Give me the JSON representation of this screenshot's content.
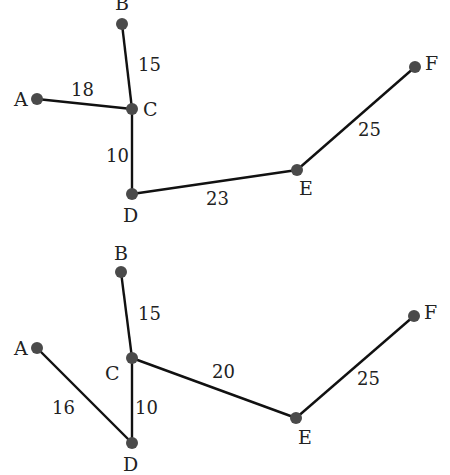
{
  "graphs": [
    {
      "name": "top-graph",
      "nodes": [
        {
          "id": "A",
          "x": 37,
          "y": 99,
          "lx": 14,
          "ly": 106
        },
        {
          "id": "B",
          "x": 122,
          "y": 24,
          "lx": 115,
          "ly": 10
        },
        {
          "id": "C",
          "x": 132,
          "y": 109,
          "lx": 143,
          "ly": 116
        },
        {
          "id": "D",
          "x": 132,
          "y": 194,
          "lx": 123,
          "ly": 222
        },
        {
          "id": "E",
          "x": 297,
          "y": 170,
          "lx": 299,
          "ly": 195
        },
        {
          "id": "F",
          "x": 415,
          "y": 67,
          "lx": 425,
          "ly": 70
        }
      ],
      "edges": [
        {
          "from": "A",
          "to": "C",
          "weight": "18",
          "wx": 71,
          "wy": 96
        },
        {
          "from": "B",
          "to": "C",
          "weight": "15",
          "wx": 138,
          "wy": 71
        },
        {
          "from": "C",
          "to": "D",
          "weight": "10",
          "wx": 106,
          "wy": 162
        },
        {
          "from": "D",
          "to": "E",
          "weight": "23",
          "wx": 206,
          "wy": 205
        },
        {
          "from": "E",
          "to": "F",
          "weight": "25",
          "wx": 358,
          "wy": 136
        }
      ]
    },
    {
      "name": "bottom-graph",
      "nodes": [
        {
          "id": "A",
          "x": 37,
          "y": 348,
          "lx": 14,
          "ly": 355
        },
        {
          "id": "B",
          "x": 121,
          "y": 272,
          "lx": 114,
          "ly": 260
        },
        {
          "id": "C",
          "x": 132,
          "y": 358,
          "lx": 105,
          "ly": 380
        },
        {
          "id": "D",
          "x": 132,
          "y": 443,
          "lx": 123,
          "ly": 471
        },
        {
          "id": "E",
          "x": 296,
          "y": 418,
          "lx": 298,
          "ly": 444
        },
        {
          "id": "F",
          "x": 414,
          "y": 316,
          "lx": 424,
          "ly": 319
        }
      ],
      "edges": [
        {
          "from": "A",
          "to": "D",
          "weight": "16",
          "wx": 52,
          "wy": 414
        },
        {
          "from": "B",
          "to": "C",
          "weight": "15",
          "wx": 138,
          "wy": 320
        },
        {
          "from": "C",
          "to": "D",
          "weight": "10",
          "wx": 135,
          "wy": 414
        },
        {
          "from": "C",
          "to": "E",
          "weight": "20",
          "wx": 212,
          "wy": 378
        },
        {
          "from": "E",
          "to": "F",
          "weight": "25",
          "wx": 357,
          "wy": 385
        }
      ]
    }
  ]
}
